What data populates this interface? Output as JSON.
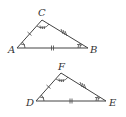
{
  "diagram": {
    "triangles": [
      {
        "name": "ABC",
        "vertices": [
          {
            "label": "A",
            "x": 17,
            "y": 48
          },
          {
            "label": "B",
            "x": 88,
            "y": 48
          },
          {
            "label": "C",
            "x": 42,
            "y": 20
          }
        ],
        "side_marks": {
          "AC": 1,
          "AB": 2,
          "CB": 3
        },
        "angle_marks": {
          "A": 1,
          "B": 2,
          "C": 3
        }
      },
      {
        "name": "DEF",
        "vertices": [
          {
            "label": "D",
            "x": 36,
            "y": 101
          },
          {
            "label": "E",
            "x": 106,
            "y": 101
          },
          {
            "label": "F",
            "x": 61,
            "y": 73
          }
        ],
        "side_marks": {
          "DF": 1,
          "DE": 2,
          "FE": 3
        },
        "angle_marks": {
          "D": 1,
          "E": 2,
          "F": 3
        }
      }
    ],
    "labels": {
      "A": "A",
      "B": "B",
      "C": "C",
      "D": "D",
      "E": "E",
      "F": "F"
    }
  }
}
